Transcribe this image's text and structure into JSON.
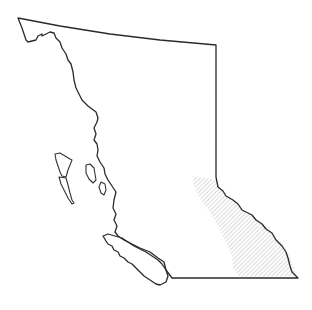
{
  "map": {
    "subject": "British Columbia outline",
    "highlighted_region": "Southeastern region (hatched)",
    "colors": {
      "outline": "#2a2a2a",
      "hatch": "#b5b5b5",
      "background": "#ffffff"
    }
  }
}
